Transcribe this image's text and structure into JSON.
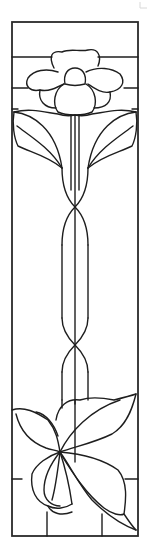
{
  "artwork": {
    "type": "stained-glass line pattern",
    "subject": "vertical panel with flower, stem and leaf cluster",
    "colors": {
      "line": "#1e1e1e",
      "background": "#ffffff",
      "frame": "#2a2a2a"
    },
    "sections": [
      {
        "name": "top-band",
        "description": "horizontal bands behind flower head"
      },
      {
        "name": "flower-head",
        "description": "five-petal flower with center bud"
      },
      {
        "name": "upper-leaves",
        "description": "pair of curved leaves flanking stem"
      },
      {
        "name": "stem",
        "description": "double-line stem with two twist crossings"
      },
      {
        "name": "bottom-leaves",
        "description": "large swirling leaf cluster"
      },
      {
        "name": "bottom-band",
        "description": "rectangular base panes"
      }
    ]
  }
}
